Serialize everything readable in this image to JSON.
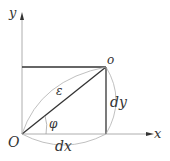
{
  "diagram": {
    "labels": {
      "y_axis": "y",
      "x_axis": "x",
      "origin": "O",
      "point": "o",
      "epsilon": "ε",
      "phi": "φ",
      "dx": "dx",
      "dy": "dy"
    },
    "colors": {
      "axis": "#9a9a9a",
      "line": "#333333",
      "arc": "#b0b0b0",
      "text": "#333333"
    }
  }
}
